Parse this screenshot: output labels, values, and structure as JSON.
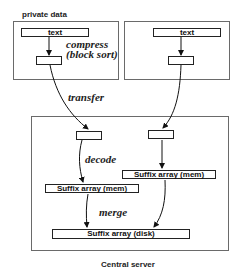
{
  "diagram": {
    "private_label": "private data",
    "left_private": {
      "text_box": "text",
      "compress_line1": "compress",
      "compress_line2": "(block sort)"
    },
    "right_private": {
      "text_box": "text"
    },
    "transfer_label": "transfer",
    "central": {
      "decode_label": "decode",
      "suffix_mem_left": "Suffix array (mem)",
      "suffix_mem_right": "Suffix array (mem)",
      "merge_label": "merge",
      "suffix_disk": "Suffix array (disk)",
      "caption": "Central server"
    }
  }
}
